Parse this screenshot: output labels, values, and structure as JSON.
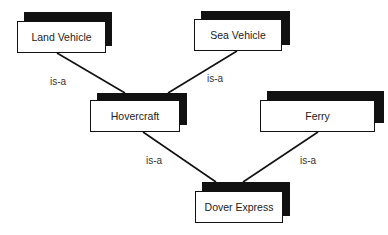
{
  "diagram": {
    "type": "inheritance-hierarchy",
    "nodes": [
      {
        "id": "land-vehicle",
        "label": "Land Vehicle",
        "box": {
          "x": 17,
          "y": 21,
          "w": 89,
          "h": 32
        },
        "shadow": {
          "x": 24,
          "y": 12,
          "w": 88,
          "h": 34
        }
      },
      {
        "id": "sea-vehicle",
        "label": "Sea Vehicle",
        "box": {
          "x": 194,
          "y": 19,
          "w": 88,
          "h": 32
        },
        "shadow": {
          "x": 201,
          "y": 11,
          "w": 89,
          "h": 34
        }
      },
      {
        "id": "hovercraft",
        "label": "Hovercraft",
        "box": {
          "x": 90,
          "y": 100,
          "w": 90,
          "h": 32
        },
        "shadow": {
          "x": 97,
          "y": 93,
          "w": 90,
          "h": 32
        }
      },
      {
        "id": "ferry",
        "label": "Ferry",
        "box": {
          "x": 260,
          "y": 100,
          "w": 115,
          "h": 32
        },
        "shadow": {
          "x": 267,
          "y": 91,
          "w": 117,
          "h": 32
        }
      },
      {
        "id": "dover-express",
        "label": "Dover Express",
        "box": {
          "x": 195,
          "y": 191,
          "w": 88,
          "h": 32
        },
        "shadow": {
          "x": 202,
          "y": 182,
          "w": 88,
          "h": 34
        }
      }
    ],
    "edges": [
      {
        "from": "hovercraft",
        "to": "land-vehicle",
        "label": "is-a",
        "x1": 57,
        "y1": 53,
        "x2": 125,
        "y2": 93,
        "lx": 50,
        "ly": 76
      },
      {
        "from": "hovercraft",
        "to": "sea-vehicle",
        "label": "is-a",
        "x1": 237,
        "y1": 51,
        "x2": 168,
        "y2": 93,
        "lx": 207,
        "ly": 73
      },
      {
        "from": "dover-express",
        "to": "hovercraft",
        "label": "is-a",
        "x1": 143,
        "y1": 132,
        "x2": 216,
        "y2": 182,
        "lx": 146,
        "ly": 155
      },
      {
        "from": "dover-express",
        "to": "ferry",
        "label": "is-a",
        "x1": 318,
        "y1": 132,
        "x2": 243,
        "y2": 182,
        "lx": 300,
        "ly": 155
      }
    ],
    "colors": {
      "line": "#111111",
      "shadow": "#111111",
      "box_fill": "#ffffff",
      "text": "#222222"
    }
  }
}
